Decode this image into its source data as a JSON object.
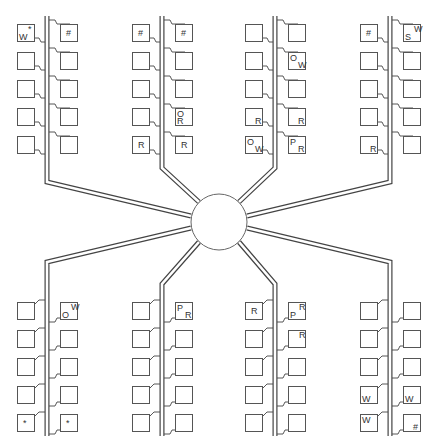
{
  "diagram": {
    "title": "",
    "hub": {
      "label": "",
      "cx": 219,
      "cy": 222,
      "r": 28
    },
    "colors": {
      "line": "#444444",
      "box": "#555555",
      "text": "#333333",
      "background": "#ffffff"
    },
    "clusters": [
      {
        "id": "top-1",
        "position": "top",
        "bus_x": 47,
        "left": [
          {
            "labels": [
              {
                "t": "W",
                "pos": "bl"
              },
              {
                "t": "*",
                "pos": "tr"
              }
            ]
          },
          {
            "labels": []
          },
          {
            "labels": []
          },
          {
            "labels": []
          },
          {
            "labels": []
          }
        ],
        "right": [
          {
            "labels": [
              {
                "t": "#",
                "pos": "c"
              }
            ]
          },
          {
            "labels": []
          },
          {
            "labels": []
          },
          {
            "labels": []
          },
          {
            "labels": []
          }
        ]
      },
      {
        "id": "top-2",
        "position": "top",
        "bus_x": 162,
        "left": [
          {
            "labels": [
              {
                "t": "#",
                "pos": "c"
              }
            ]
          },
          {
            "labels": []
          },
          {
            "labels": []
          },
          {
            "labels": []
          },
          {
            "labels": [
              {
                "t": "R",
                "pos": "c"
              }
            ]
          }
        ],
        "right": [
          {
            "labels": [
              {
                "t": "#",
                "pos": "c"
              }
            ]
          },
          {
            "labels": []
          },
          {
            "labels": []
          },
          {
            "labels": [
              {
                "t": "O",
                "pos": "tl"
              },
              {
                "t": "R",
                "pos": "bl"
              }
            ]
          },
          {
            "labels": [
              {
                "t": "R",
                "pos": "c"
              }
            ]
          }
        ]
      },
      {
        "id": "top-3",
        "position": "top",
        "bus_x": 275,
        "left": [
          {
            "labels": []
          },
          {
            "labels": []
          },
          {
            "labels": []
          },
          {
            "labels": [
              {
                "t": "R",
                "pos": "br"
              }
            ]
          },
          {
            "labels": [
              {
                "t": "O",
                "pos": "tl"
              },
              {
                "t": "W",
                "pos": "br"
              }
            ]
          }
        ],
        "right": [
          {
            "labels": []
          },
          {
            "labels": [
              {
                "t": "O",
                "pos": "tl"
              },
              {
                "t": "W",
                "pos": "br"
              }
            ]
          },
          {
            "labels": []
          },
          {
            "labels": [
              {
                "t": "R",
                "pos": "br"
              }
            ]
          },
          {
            "labels": [
              {
                "t": "P",
                "pos": "tl"
              },
              {
                "t": "R",
                "pos": "br"
              }
            ]
          }
        ]
      },
      {
        "id": "top-4",
        "position": "top",
        "bus_x": 390,
        "left": [
          {
            "labels": [
              {
                "t": "#",
                "pos": "c"
              }
            ]
          },
          {
            "labels": []
          },
          {
            "labels": []
          },
          {
            "labels": []
          },
          {
            "labels": [
              {
                "t": "R",
                "pos": "br"
              }
            ]
          }
        ],
        "right": [
          {
            "labels": [
              {
                "t": "S",
                "pos": "bl"
              },
              {
                "t": "W",
                "pos": "tr"
              }
            ]
          },
          {
            "labels": []
          },
          {
            "labels": []
          },
          {
            "labels": []
          },
          {
            "labels": []
          }
        ]
      },
      {
        "id": "bottom-1",
        "position": "bottom",
        "bus_x": 47,
        "left": [
          {
            "labels": []
          },
          {
            "labels": []
          },
          {
            "labels": []
          },
          {
            "labels": []
          },
          {
            "labels": [
              {
                "t": "*",
                "pos": "c"
              }
            ]
          }
        ],
        "right": [
          {
            "labels": [
              {
                "t": "O",
                "pos": "bl"
              },
              {
                "t": "W",
                "pos": "tr"
              }
            ]
          },
          {
            "labels": []
          },
          {
            "labels": []
          },
          {
            "labels": []
          },
          {
            "labels": [
              {
                "t": "*",
                "pos": "c"
              }
            ]
          }
        ]
      },
      {
        "id": "bottom-2",
        "position": "bottom",
        "bus_x": 162,
        "left": [
          {
            "labels": []
          },
          {
            "labels": []
          },
          {
            "labels": []
          },
          {
            "labels": []
          },
          {
            "labels": []
          }
        ],
        "right": [
          {
            "labels": [
              {
                "t": "P",
                "pos": "tl"
              },
              {
                "t": "R",
                "pos": "br"
              }
            ]
          },
          {
            "labels": []
          },
          {
            "labels": []
          },
          {
            "labels": []
          },
          {
            "labels": []
          }
        ]
      },
      {
        "id": "bottom-3",
        "position": "bottom",
        "bus_x": 275,
        "left": [
          {
            "labels": [
              {
                "t": "R",
                "pos": "c"
              }
            ]
          },
          {
            "labels": []
          },
          {
            "labels": []
          },
          {
            "labels": []
          },
          {
            "labels": []
          }
        ],
        "right": [
          {
            "labels": [
              {
                "t": "P",
                "pos": "bl"
              },
              {
                "t": "R",
                "pos": "tr"
              }
            ]
          },
          {
            "labels": [
              {
                "t": "R",
                "pos": "tr"
              }
            ]
          },
          {
            "labels": []
          },
          {
            "labels": []
          },
          {
            "labels": []
          }
        ]
      },
      {
        "id": "bottom-4",
        "position": "bottom",
        "bus_x": 390,
        "left": [
          {
            "labels": []
          },
          {
            "labels": []
          },
          {
            "labels": []
          },
          {
            "labels": [
              {
                "t": "W",
                "pos": "bl"
              }
            ]
          },
          {
            "labels": [
              {
                "t": "W",
                "pos": "tl"
              }
            ]
          }
        ],
        "right": [
          {
            "labels": []
          },
          {
            "labels": []
          },
          {
            "labels": []
          },
          {
            "labels": [
              {
                "t": "W",
                "pos": "bl"
              }
            ]
          },
          {
            "labels": [
              {
                "t": "#",
                "pos": "br"
              }
            ]
          }
        ]
      }
    ]
  }
}
